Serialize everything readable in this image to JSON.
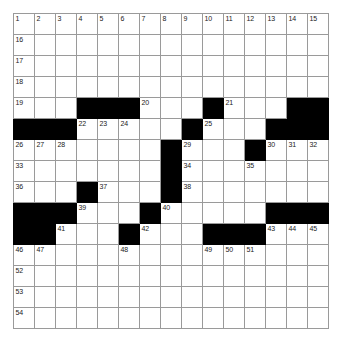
{
  "puzzle": {
    "type": "crossword-grid",
    "rows": 15,
    "columns": 15,
    "cell_size_px": 21,
    "colors": {
      "block": "#000000",
      "cell": "#ffffff",
      "grid_line": "#9a9a9a",
      "number_text": "#1a1a1a",
      "page_background": "#ffffff"
    },
    "grid": [
      [
        {
          "block": false,
          "number": "1"
        },
        {
          "block": false,
          "number": "2"
        },
        {
          "block": false,
          "number": "3"
        },
        {
          "block": false,
          "number": "4"
        },
        {
          "block": false,
          "number": "5"
        },
        {
          "block": false,
          "number": "6"
        },
        {
          "block": false,
          "number": "7"
        },
        {
          "block": false,
          "number": "8"
        },
        {
          "block": false,
          "number": "9"
        },
        {
          "block": false,
          "number": "10"
        },
        {
          "block": false,
          "number": "11"
        },
        {
          "block": false,
          "number": "12"
        },
        {
          "block": false,
          "number": "13"
        },
        {
          "block": false,
          "number": "14"
        },
        {
          "block": false,
          "number": "15"
        }
      ],
      [
        {
          "block": false,
          "number": "16"
        },
        {
          "block": false,
          "number": ""
        },
        {
          "block": false,
          "number": ""
        },
        {
          "block": false,
          "number": ""
        },
        {
          "block": false,
          "number": ""
        },
        {
          "block": false,
          "number": ""
        },
        {
          "block": false,
          "number": ""
        },
        {
          "block": false,
          "number": ""
        },
        {
          "block": false,
          "number": ""
        },
        {
          "block": false,
          "number": ""
        },
        {
          "block": false,
          "number": ""
        },
        {
          "block": false,
          "number": ""
        },
        {
          "block": false,
          "number": ""
        },
        {
          "block": false,
          "number": ""
        },
        {
          "block": false,
          "number": ""
        }
      ],
      [
        {
          "block": false,
          "number": "17"
        },
        {
          "block": false,
          "number": ""
        },
        {
          "block": false,
          "number": ""
        },
        {
          "block": false,
          "number": ""
        },
        {
          "block": false,
          "number": ""
        },
        {
          "block": false,
          "number": ""
        },
        {
          "block": false,
          "number": ""
        },
        {
          "block": false,
          "number": ""
        },
        {
          "block": false,
          "number": ""
        },
        {
          "block": false,
          "number": ""
        },
        {
          "block": false,
          "number": ""
        },
        {
          "block": false,
          "number": ""
        },
        {
          "block": false,
          "number": ""
        },
        {
          "block": false,
          "number": ""
        },
        {
          "block": false,
          "number": ""
        }
      ],
      [
        {
          "block": false,
          "number": "18"
        },
        {
          "block": false,
          "number": ""
        },
        {
          "block": false,
          "number": ""
        },
        {
          "block": false,
          "number": ""
        },
        {
          "block": false,
          "number": ""
        },
        {
          "block": false,
          "number": ""
        },
        {
          "block": false,
          "number": ""
        },
        {
          "block": false,
          "number": ""
        },
        {
          "block": false,
          "number": ""
        },
        {
          "block": false,
          "number": ""
        },
        {
          "block": false,
          "number": ""
        },
        {
          "block": false,
          "number": ""
        },
        {
          "block": false,
          "number": ""
        },
        {
          "block": false,
          "number": ""
        },
        {
          "block": false,
          "number": ""
        }
      ],
      [
        {
          "block": false,
          "number": "19"
        },
        {
          "block": false,
          "number": ""
        },
        {
          "block": false,
          "number": ""
        },
        {
          "block": true,
          "number": ""
        },
        {
          "block": true,
          "number": ""
        },
        {
          "block": true,
          "number": ""
        },
        {
          "block": false,
          "number": "20"
        },
        {
          "block": false,
          "number": ""
        },
        {
          "block": false,
          "number": ""
        },
        {
          "block": true,
          "number": ""
        },
        {
          "block": false,
          "number": "21"
        },
        {
          "block": false,
          "number": ""
        },
        {
          "block": false,
          "number": ""
        },
        {
          "block": true,
          "number": ""
        },
        {
          "block": true,
          "number": ""
        }
      ],
      [
        {
          "block": true,
          "number": ""
        },
        {
          "block": true,
          "number": ""
        },
        {
          "block": true,
          "number": ""
        },
        {
          "block": false,
          "number": "22"
        },
        {
          "block": false,
          "number": "23"
        },
        {
          "block": false,
          "number": "24"
        },
        {
          "block": false,
          "number": ""
        },
        {
          "block": false,
          "number": ""
        },
        {
          "block": true,
          "number": ""
        },
        {
          "block": false,
          "number": "25"
        },
        {
          "block": false,
          "number": ""
        },
        {
          "block": false,
          "number": ""
        },
        {
          "block": true,
          "number": ""
        },
        {
          "block": true,
          "number": ""
        },
        {
          "block": true,
          "number": ""
        }
      ],
      [
        {
          "block": false,
          "number": "26"
        },
        {
          "block": false,
          "number": "27"
        },
        {
          "block": false,
          "number": "28"
        },
        {
          "block": false,
          "number": ""
        },
        {
          "block": false,
          "number": ""
        },
        {
          "block": false,
          "number": ""
        },
        {
          "block": false,
          "number": ""
        },
        {
          "block": true,
          "number": ""
        },
        {
          "block": false,
          "number": "29"
        },
        {
          "block": false,
          "number": ""
        },
        {
          "block": false,
          "number": ""
        },
        {
          "block": true,
          "number": ""
        },
        {
          "block": false,
          "number": "30"
        },
        {
          "block": false,
          "number": "31"
        },
        {
          "block": false,
          "number": "32"
        }
      ],
      [
        {
          "block": false,
          "number": "33"
        },
        {
          "block": false,
          "number": ""
        },
        {
          "block": false,
          "number": ""
        },
        {
          "block": false,
          "number": ""
        },
        {
          "block": false,
          "number": ""
        },
        {
          "block": false,
          "number": ""
        },
        {
          "block": false,
          "number": ""
        },
        {
          "block": true,
          "number": ""
        },
        {
          "block": false,
          "number": "34"
        },
        {
          "block": false,
          "number": ""
        },
        {
          "block": false,
          "number": ""
        },
        {
          "block": false,
          "number": "35"
        },
        {
          "block": false,
          "number": ""
        },
        {
          "block": false,
          "number": ""
        },
        {
          "block": false,
          "number": ""
        }
      ],
      [
        {
          "block": false,
          "number": "36"
        },
        {
          "block": false,
          "number": ""
        },
        {
          "block": false,
          "number": ""
        },
        {
          "block": true,
          "number": ""
        },
        {
          "block": false,
          "number": "37"
        },
        {
          "block": false,
          "number": ""
        },
        {
          "block": false,
          "number": ""
        },
        {
          "block": true,
          "number": ""
        },
        {
          "block": false,
          "number": "38"
        },
        {
          "block": false,
          "number": ""
        },
        {
          "block": false,
          "number": ""
        },
        {
          "block": false,
          "number": ""
        },
        {
          "block": false,
          "number": ""
        },
        {
          "block": false,
          "number": ""
        },
        {
          "block": false,
          "number": ""
        }
      ],
      [
        {
          "block": true,
          "number": ""
        },
        {
          "block": true,
          "number": ""
        },
        {
          "block": true,
          "number": ""
        },
        {
          "block": false,
          "number": "39"
        },
        {
          "block": false,
          "number": ""
        },
        {
          "block": false,
          "number": ""
        },
        {
          "block": true,
          "number": ""
        },
        {
          "block": false,
          "number": "40"
        },
        {
          "block": false,
          "number": ""
        },
        {
          "block": false,
          "number": ""
        },
        {
          "block": false,
          "number": ""
        },
        {
          "block": false,
          "number": ""
        },
        {
          "block": true,
          "number": ""
        },
        {
          "block": true,
          "number": ""
        },
        {
          "block": true,
          "number": ""
        }
      ],
      [
        {
          "block": true,
          "number": ""
        },
        {
          "block": true,
          "number": ""
        },
        {
          "block": false,
          "number": "41"
        },
        {
          "block": false,
          "number": ""
        },
        {
          "block": false,
          "number": ""
        },
        {
          "block": true,
          "number": ""
        },
        {
          "block": false,
          "number": "42"
        },
        {
          "block": false,
          "number": ""
        },
        {
          "block": false,
          "number": ""
        },
        {
          "block": true,
          "number": ""
        },
        {
          "block": true,
          "number": ""
        },
        {
          "block": true,
          "number": ""
        },
        {
          "block": false,
          "number": "43"
        },
        {
          "block": false,
          "number": "44"
        },
        {
          "block": false,
          "number": "45"
        }
      ],
      [
        {
          "block": false,
          "number": "46"
        },
        {
          "block": false,
          "number": "47"
        },
        {
          "block": false,
          "number": ""
        },
        {
          "block": false,
          "number": ""
        },
        {
          "block": false,
          "number": ""
        },
        {
          "block": false,
          "number": "48"
        },
        {
          "block": false,
          "number": ""
        },
        {
          "block": false,
          "number": ""
        },
        {
          "block": false,
          "number": ""
        },
        {
          "block": false,
          "number": "49"
        },
        {
          "block": false,
          "number": "50"
        },
        {
          "block": false,
          "number": "51"
        },
        {
          "block": false,
          "number": ""
        },
        {
          "block": false,
          "number": ""
        },
        {
          "block": false,
          "number": ""
        }
      ],
      [
        {
          "block": false,
          "number": "52"
        },
        {
          "block": false,
          "number": ""
        },
        {
          "block": false,
          "number": ""
        },
        {
          "block": false,
          "number": ""
        },
        {
          "block": false,
          "number": ""
        },
        {
          "block": false,
          "number": ""
        },
        {
          "block": false,
          "number": ""
        },
        {
          "block": false,
          "number": ""
        },
        {
          "block": false,
          "number": ""
        },
        {
          "block": false,
          "number": ""
        },
        {
          "block": false,
          "number": ""
        },
        {
          "block": false,
          "number": ""
        },
        {
          "block": false,
          "number": ""
        },
        {
          "block": false,
          "number": ""
        },
        {
          "block": false,
          "number": ""
        }
      ],
      [
        {
          "block": false,
          "number": "53"
        },
        {
          "block": false,
          "number": ""
        },
        {
          "block": false,
          "number": ""
        },
        {
          "block": false,
          "number": ""
        },
        {
          "block": false,
          "number": ""
        },
        {
          "block": false,
          "number": ""
        },
        {
          "block": false,
          "number": ""
        },
        {
          "block": false,
          "number": ""
        },
        {
          "block": false,
          "number": ""
        },
        {
          "block": false,
          "number": ""
        },
        {
          "block": false,
          "number": ""
        },
        {
          "block": false,
          "number": ""
        },
        {
          "block": false,
          "number": ""
        },
        {
          "block": false,
          "number": ""
        },
        {
          "block": false,
          "number": ""
        }
      ],
      [
        {
          "block": false,
          "number": "54"
        },
        {
          "block": false,
          "number": ""
        },
        {
          "block": false,
          "number": ""
        },
        {
          "block": false,
          "number": ""
        },
        {
          "block": false,
          "number": ""
        },
        {
          "block": false,
          "number": ""
        },
        {
          "block": false,
          "number": ""
        },
        {
          "block": false,
          "number": ""
        },
        {
          "block": false,
          "number": ""
        },
        {
          "block": false,
          "number": ""
        },
        {
          "block": false,
          "number": ""
        },
        {
          "block": false,
          "number": ""
        },
        {
          "block": false,
          "number": ""
        },
        {
          "block": false,
          "number": ""
        },
        {
          "block": false,
          "number": ""
        }
      ]
    ]
  }
}
